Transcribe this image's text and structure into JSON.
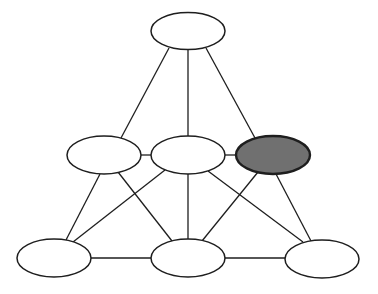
{
  "diagram": {
    "type": "graph",
    "colors": {
      "background": "#ffffff",
      "stroke": "#1e1e1e",
      "node_fill": "#ffffff",
      "highlight_fill": "#707070"
    },
    "nodes": [
      {
        "id": "top",
        "cx": 188,
        "cy": 31,
        "rx": 37,
        "ry": 18.5,
        "highlighted": false
      },
      {
        "id": "middle-left",
        "cx": 104,
        "cy": 155,
        "rx": 37,
        "ry": 19,
        "highlighted": false
      },
      {
        "id": "middle-center",
        "cx": 188,
        "cy": 155,
        "rx": 37,
        "ry": 19,
        "highlighted": false
      },
      {
        "id": "middle-right",
        "cx": 273,
        "cy": 155,
        "rx": 37,
        "ry": 19,
        "highlighted": true
      },
      {
        "id": "bottom-left",
        "cx": 54,
        "cy": 258,
        "rx": 37,
        "ry": 19,
        "highlighted": false
      },
      {
        "id": "bottom-center",
        "cx": 188,
        "cy": 258,
        "rx": 37,
        "ry": 19,
        "highlighted": false
      },
      {
        "id": "bottom-right",
        "cx": 322,
        "cy": 259,
        "rx": 37,
        "ry": 19,
        "highlighted": false
      }
    ],
    "edges": [
      {
        "from": "top",
        "to": "middle-left",
        "x1": 169,
        "y1": 48,
        "x2": 121,
        "y2": 138
      },
      {
        "from": "top",
        "to": "middle-center",
        "x1": 188,
        "y1": 50,
        "x2": 188,
        "y2": 136
      },
      {
        "from": "top",
        "to": "middle-right",
        "x1": 206,
        "y1": 48,
        "x2": 255,
        "y2": 138
      },
      {
        "from": "middle-left",
        "to": "middle-center",
        "x1": 141,
        "y1": 155,
        "x2": 151,
        "y2": 155
      },
      {
        "from": "middle-center",
        "to": "middle-right",
        "x1": 225,
        "y1": 155,
        "x2": 236,
        "y2": 155
      },
      {
        "from": "middle-left",
        "to": "bottom-left",
        "x1": 100,
        "y1": 174,
        "x2": 66,
        "y2": 240
      },
      {
        "from": "middle-left",
        "to": "bottom-center",
        "x1": 118,
        "y1": 172,
        "x2": 172,
        "y2": 241
      },
      {
        "from": "middle-center",
        "to": "bottom-left",
        "x1": 165,
        "y1": 170,
        "x2": 73,
        "y2": 242
      },
      {
        "from": "middle-center",
        "to": "bottom-center",
        "x1": 188,
        "y1": 174,
        "x2": 188,
        "y2": 239
      },
      {
        "from": "middle-center",
        "to": "bottom-right",
        "x1": 208,
        "y1": 171,
        "x2": 303,
        "y2": 242
      },
      {
        "from": "middle-right",
        "to": "bottom-center",
        "x1": 258,
        "y1": 172,
        "x2": 202,
        "y2": 241
      },
      {
        "from": "middle-right",
        "to": "bottom-right",
        "x1": 276,
        "y1": 174,
        "x2": 311,
        "y2": 241
      },
      {
        "from": "bottom-left",
        "to": "bottom-center",
        "x1": 91,
        "y1": 258,
        "x2": 151,
        "y2": 258
      },
      {
        "from": "bottom-center",
        "to": "bottom-right",
        "x1": 225,
        "y1": 258,
        "x2": 285,
        "y2": 258
      }
    ]
  }
}
